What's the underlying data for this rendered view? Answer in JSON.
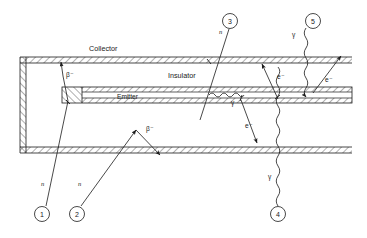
{
  "figure": {
    "type": "cross-section-diagram",
    "background_color": "#ffffff",
    "line_color": "#1a1a1a"
  },
  "structure_labels": {
    "collector": "Collector",
    "insulator": "Insulator",
    "emitter": "Emitter"
  },
  "particle_labels": {
    "neutron": "n",
    "beta_minus": "β⁻",
    "electron": "e⁻",
    "gamma": "γ"
  },
  "callouts": [
    {
      "id": "1",
      "label": "1",
      "cx": 42,
      "cy": 214,
      "r": 7.5
    },
    {
      "id": "2",
      "label": "2",
      "cx": 77,
      "cy": 214,
      "r": 7.5
    },
    {
      "id": "3",
      "label": "3",
      "cx": 230,
      "cy": 21,
      "r": 7.5
    },
    {
      "id": "4",
      "label": "4",
      "cx": 278,
      "cy": 214,
      "r": 7.5
    },
    {
      "id": "5",
      "label": "5",
      "cx": 313,
      "cy": 21,
      "r": 7.5
    }
  ],
  "path_labels": [
    {
      "name": "neutron-1",
      "text": "n",
      "x": 41,
      "y": 186
    },
    {
      "name": "neutron-2",
      "text": "n",
      "x": 78,
      "y": 186
    },
    {
      "name": "beta-1",
      "text": "β⁻",
      "x": 66,
      "y": 77
    },
    {
      "name": "beta-2",
      "text": "β⁻",
      "x": 146,
      "y": 131
    },
    {
      "name": "neutron-3",
      "text": "n",
      "x": 219,
      "y": 34
    },
    {
      "name": "gamma-emitter",
      "text": "γ",
      "x": 231,
      "y": 105
    },
    {
      "name": "electron-3",
      "text": "e⁻",
      "x": 245,
      "y": 128
    },
    {
      "name": "electron-4",
      "text": "e⁻",
      "x": 277,
      "y": 79
    },
    {
      "name": "gamma-4",
      "text": "γ",
      "x": 268,
      "y": 179
    },
    {
      "name": "gamma-5",
      "text": "γ",
      "x": 292,
      "y": 37
    },
    {
      "name": "electron-5",
      "text": "e⁻",
      "x": 325,
      "y": 82
    }
  ],
  "geometry": {
    "collector_top_y": 57,
    "collector_bottom_y": 63,
    "emitter_top_y": 87,
    "emitter_bottom_y": 103,
    "bottom_wall_top_y": 147,
    "bottom_wall_bottom_y": 153,
    "left_wall_x": 20,
    "right_edge_x": 352,
    "emitter_left_x": 62
  }
}
